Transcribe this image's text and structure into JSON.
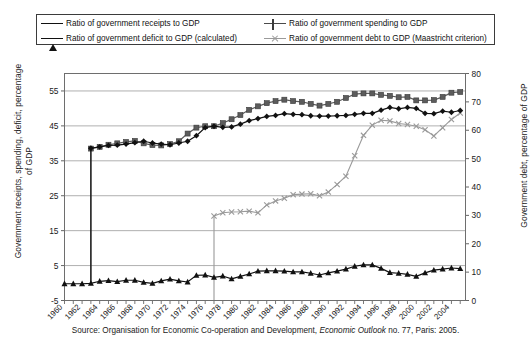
{
  "legend": {
    "items": [
      {
        "label": "Ratio of government receipts to GDP",
        "marker": "diamond-marker",
        "color": "#111111"
      },
      {
        "label": "Ratio of government spending to GDP",
        "marker": "square-marker",
        "color": "#5c5c5c"
      },
      {
        "label": "Ratio of government deficit to GDP (calculated)",
        "marker": "triangle-marker",
        "color": "#111111"
      },
      {
        "label": "Ratio of government debt to GDP (Maastricht criterion)",
        "marker": "x-marker",
        "color": "#9a9a9a"
      }
    ]
  },
  "axes": {
    "left_title": "Government receipts, spending, deficit, percentage of GDP",
    "right_title": "Government debt, percentage of GDP",
    "left_ticks": [
      "-5",
      "5",
      "15",
      "25",
      "35",
      "45",
      "55"
    ],
    "right_ticks": [
      "0",
      "10",
      "20",
      "30",
      "40",
      "50",
      "60",
      "70",
      "80"
    ],
    "x_ticks": [
      "1960",
      "1962",
      "1964",
      "1966",
      "1968",
      "1970",
      "1972",
      "1974",
      "1976",
      "1978",
      "1980",
      "1982",
      "1984",
      "1986",
      "1988",
      "1990",
      "1992",
      "1994",
      "1996",
      "1998",
      "2000",
      "2002",
      "2004"
    ]
  },
  "source": {
    "prefix": "Source: Organisation for Economic Co-operation and Development, ",
    "italic": "Economic Outlook",
    "suffix": " no. 77, Paris: 2005."
  },
  "chart_data": {
    "type": "line",
    "title": "",
    "xlabel": "",
    "ylabel": "Government receipts, spending, deficit, percentage of GDP",
    "y2label": "Government debt, percentage of GDP",
    "ylim": [
      -5,
      60
    ],
    "y2lim": [
      0,
      80
    ],
    "grid": true,
    "legend_position": "top",
    "x": [
      1960,
      1961,
      1962,
      1963,
      1964,
      1965,
      1966,
      1967,
      1968,
      1969,
      1970,
      1971,
      1972,
      1973,
      1974,
      1975,
      1976,
      1977,
      1978,
      1979,
      1980,
      1981,
      1982,
      1983,
      1984,
      1985,
      1986,
      1987,
      1988,
      1989,
      1990,
      1991,
      1992,
      1993,
      1994,
      1995,
      1996,
      1997,
      1998,
      1999,
      2000,
      2001,
      2002,
      2003,
      2004,
      2005
    ],
    "series": [
      {
        "name": "Ratio of government receipts to GDP",
        "axis": "left",
        "marker": "diamond",
        "color": "#111111",
        "values": [
          null,
          null,
          null,
          38.6,
          39.0,
          39.4,
          39.5,
          39.8,
          40.2,
          40.6,
          40.1,
          39.8,
          39.6,
          40.1,
          40.6,
          42.2,
          44.5,
          44.9,
          44.6,
          44.7,
          45.5,
          46.5,
          47.1,
          47.7,
          48.0,
          48.5,
          48.3,
          48.2,
          47.9,
          47.8,
          47.8,
          47.9,
          48.0,
          48.3,
          48.6,
          48.6,
          49.5,
          50.3,
          49.9,
          50.3,
          50.0,
          48.6,
          48.5,
          49.2,
          48.9,
          49.4
        ]
      },
      {
        "name": "Ratio of government spending to GDP",
        "axis": "left",
        "marker": "square",
        "color": "#5c5c5c",
        "values": [
          null,
          null,
          null,
          38.5,
          39.0,
          39.6,
          40.0,
          40.4,
          40.7,
          40.0,
          39.5,
          39.4,
          39.8,
          40.6,
          42.8,
          44.5,
          44.9,
          44.9,
          45.8,
          46.9,
          48.1,
          49.6,
          50.6,
          51.5,
          52.1,
          52.5,
          52.1,
          51.9,
          51.3,
          50.8,
          51.3,
          51.9,
          53.0,
          54.1,
          54.3,
          54.3,
          53.9,
          53.6,
          53.2,
          53.3,
          52.3,
          52.3,
          52.4,
          53.3,
          54.5,
          54.7
        ]
      },
      {
        "name": "Ratio of government deficit to GDP (calculated)",
        "axis": "left",
        "marker": "triangle",
        "color": "#111111",
        "values": [
          -0.2,
          -0.2,
          -0.2,
          -0.1,
          0.5,
          0.7,
          0.4,
          0.8,
          0.8,
          0.2,
          -0.1,
          0.6,
          1.1,
          0.6,
          0.3,
          2.2,
          2.3,
          1.6,
          2.0,
          1.2,
          1.9,
          2.6,
          3.4,
          3.5,
          3.5,
          3.4,
          3.2,
          3.2,
          2.8,
          2.3,
          2.9,
          3.4,
          4.0,
          4.8,
          5.2,
          5.2,
          4.2,
          3.0,
          2.8,
          2.5,
          1.9,
          2.9,
          3.7,
          4.0,
          4.3,
          4.1
        ]
      },
      {
        "name": "Ratio of government debt to GDP (Maastricht criterion)",
        "axis": "right",
        "marker": "x",
        "color": "#9a9a9a",
        "values": [
          null,
          null,
          null,
          null,
          null,
          null,
          null,
          null,
          null,
          null,
          null,
          null,
          null,
          null,
          null,
          null,
          null,
          29.8,
          30.9,
          31.2,
          31.3,
          31.5,
          30.9,
          33.7,
          35.1,
          36.0,
          37.3,
          37.5,
          37.6,
          36.9,
          38.2,
          40.9,
          43.8,
          51.0,
          58.2,
          61.8,
          63.5,
          63.3,
          62.4,
          62.0,
          61.4,
          60.2,
          58.0,
          60.9,
          63.8,
          66.1
        ]
      }
    ]
  }
}
